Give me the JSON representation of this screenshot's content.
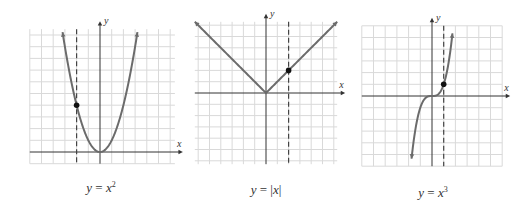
{
  "figure": {
    "colors": {
      "grid": "#d9d9d9",
      "axis": "#333333",
      "curve": "#6b6b6b",
      "dashed": "#444444",
      "point": "#111111"
    },
    "graphs": [
      {
        "id": "square",
        "caption": {
          "y": "y",
          "eq": " = ",
          "x": "x",
          "sup": "2",
          "abs": false
        },
        "origin": [
          100,
          152
        ],
        "unit": 11.7,
        "grid": {
          "xmin": -6,
          "xmax": 6.4,
          "ymin": -1,
          "ymax": 10.5
        },
        "function": "square",
        "domain": [
          -3.2,
          3.2
        ],
        "dashed_x": -2,
        "point": [
          -2,
          4
        ],
        "axis_labels": {
          "x": "x",
          "y": "y"
        },
        "caption_pos": [
          101,
          180
        ]
      },
      {
        "id": "abs",
        "caption": {
          "y": "y",
          "eq": " = ",
          "x": "x",
          "sup": "",
          "abs": true
        },
        "origin": [
          266,
          93
        ],
        "unit": 11.3,
        "grid": {
          "xmin": -6.3,
          "xmax": 6.3,
          "ymin": -6.3,
          "ymax": 6.3
        },
        "function": "abs",
        "domain": [
          -6.3,
          6.3
        ],
        "dashed_x": 2,
        "point": [
          2,
          2
        ],
        "axis_labels": {
          "x": "x",
          "y": "y"
        },
        "caption_pos": [
          266,
          182
        ]
      },
      {
        "id": "cube",
        "caption": {
          "y": "y",
          "eq": " = ",
          "x": "x",
          "sup": "3",
          "abs": false
        },
        "origin": [
          432,
          96
        ],
        "unit": 11.7,
        "grid": {
          "xmin": -6,
          "xmax": 6,
          "ymin": -6,
          "ymax": 6
        },
        "function": "cube",
        "domain": [
          -1.75,
          1.75
        ],
        "dashed_x": 1,
        "point": [
          1,
          1
        ],
        "axis_labels": {
          "x": "x",
          "y": "y"
        },
        "caption_pos": [
          433,
          185
        ]
      }
    ]
  }
}
